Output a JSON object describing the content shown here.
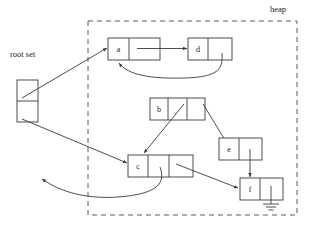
{
  "diagram": {
    "heap": {
      "label": "heap"
    },
    "root_set": {
      "label": "root set",
      "cells": [
        "",
        ""
      ]
    },
    "nodes": [
      {
        "id": "a",
        "label": "a",
        "cells": 2,
        "null_terminated": false
      },
      {
        "id": "d",
        "label": "d",
        "cells": 2,
        "null_terminated": false
      },
      {
        "id": "b",
        "label": "b",
        "cells": 3,
        "null_terminated": false
      },
      {
        "id": "c",
        "label": "c",
        "cells": 3,
        "null_terminated": false
      },
      {
        "id": "e",
        "label": "e",
        "cells": 2,
        "null_terminated": false
      },
      {
        "id": "f",
        "label": "f",
        "cells": 2,
        "null_terminated": true
      }
    ],
    "edges": [
      {
        "from": "root-set-cell-1",
        "to": "a"
      },
      {
        "from": "root-set-cell-2",
        "to": "c"
      },
      {
        "from": "a",
        "to": "d"
      },
      {
        "from": "d",
        "to": "a"
      },
      {
        "from": "b",
        "to": "c"
      },
      {
        "from": "b",
        "to": "e"
      },
      {
        "from": "e",
        "to": "f"
      },
      {
        "from": "c",
        "to": "f"
      },
      {
        "from": "c",
        "to": "outside-heap"
      }
    ],
    "colors": {
      "stroke": "#3a3a3a",
      "text": "#1a1a1a",
      "background": "#ffffff"
    }
  }
}
